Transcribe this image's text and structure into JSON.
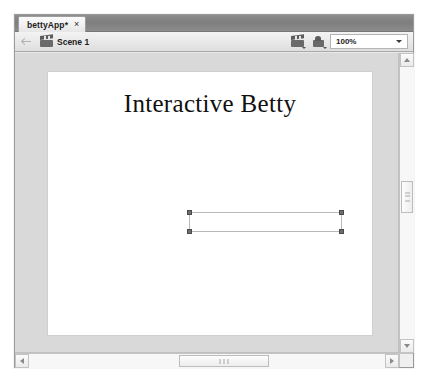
{
  "window": {
    "name": "flash-document-window"
  },
  "tab_strip": {
    "tabs": [
      {
        "label": "bettyApp*",
        "close_glyph": "×",
        "active": true
      }
    ]
  },
  "edit_bar": {
    "back_icon": "back-arrow-icon",
    "scene_icon": "clapper-icon",
    "scene_label": "Scene 1",
    "edit_scene_icon": "edit-scene-icon",
    "edit_symbols_icon": "edit-symbols-icon",
    "zoom": {
      "value": "100%",
      "caret": "▾"
    }
  },
  "stage": {
    "title": "Interactive Betty",
    "selection": {
      "name": "text-field-selection",
      "handles": 4,
      "content": ""
    }
  },
  "scrollbars": {
    "vertical": {
      "up_glyph": "▲",
      "down_glyph": "▼"
    },
    "horizontal": {
      "left_glyph": "◀",
      "right_glyph": "▶"
    }
  },
  "colors": {
    "tab_bar": "#7e7e7e",
    "edit_bar": "#e9e9e9",
    "work_area": "#d9d9d9",
    "stage": "#ffffff",
    "handle": "#6d6d6d",
    "text": "#101010"
  }
}
